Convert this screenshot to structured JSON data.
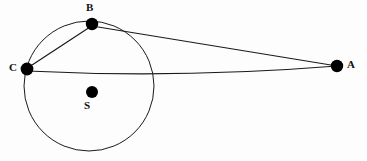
{
  "figure": {
    "kind": "geometry-diagram",
    "canvas": {
      "width": 367,
      "height": 161
    },
    "background_color": "#fdfdfd",
    "stroke_color": "#1a1a1a",
    "point_color": "#000000"
  },
  "circle": {
    "name": "main-circle",
    "cx": 89,
    "cy": 86,
    "r": 65,
    "stroke_width": 1
  },
  "points": [
    {
      "id": "B",
      "label": "B",
      "cx": 92,
      "cy": 24,
      "r": 6.2,
      "label_x": 86,
      "label_y": 2
    },
    {
      "id": "C",
      "label": "C",
      "cx": 27,
      "cy": 69,
      "r": 6.4,
      "label_x": 9,
      "label_y": 62
    },
    {
      "id": "S",
      "label": "S",
      "cx": 92,
      "cy": 92,
      "r": 6.0,
      "label_x": 84,
      "label_y": 100
    },
    {
      "id": "A",
      "label": "A",
      "cx": 337,
      "cy": 66,
      "r": 6.2,
      "label_x": 347,
      "label_y": 59
    }
  ],
  "segments": [
    {
      "id": "BA",
      "name": "segment-b-a",
      "from": "B",
      "to": "A",
      "x1": 92,
      "y1": 26,
      "x2": 337,
      "y2": 66,
      "stroke_width": 1.2
    },
    {
      "id": "CA",
      "name": "segment-c-a",
      "from": "C",
      "to": "A",
      "x1": 27,
      "y1": 71,
      "x2": 337,
      "y2": 66,
      "stroke_width": 1.2,
      "bow": 10
    },
    {
      "id": "CB",
      "name": "segment-c-b",
      "from": "C",
      "to": "B",
      "x1": 29,
      "y1": 67,
      "x2": 90,
      "y2": 27,
      "stroke_width": 1.2
    }
  ],
  "labels": {
    "B": "B",
    "C": "C",
    "S": "S",
    "A": "A"
  }
}
